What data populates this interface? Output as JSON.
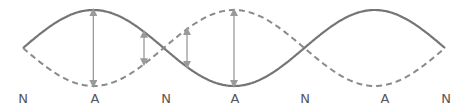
{
  "diagram": {
    "type": "standing-wave",
    "loops": 3,
    "labels": [
      "N",
      "A",
      "N",
      "A",
      "N",
      "A",
      "N"
    ],
    "legend": {
      "solid": "wave at one extreme",
      "dashed": "wave at opposite extreme"
    },
    "arrows": [
      {
        "position": "antinode",
        "loop": 1
      },
      {
        "position": "between",
        "loop": 1
      },
      {
        "position": "between",
        "loop": 2
      },
      {
        "position": "antinode",
        "loop": 2
      }
    ],
    "colors": {
      "wave": "#757575",
      "arrow": "#9a9a9a",
      "label": "#555555"
    }
  }
}
